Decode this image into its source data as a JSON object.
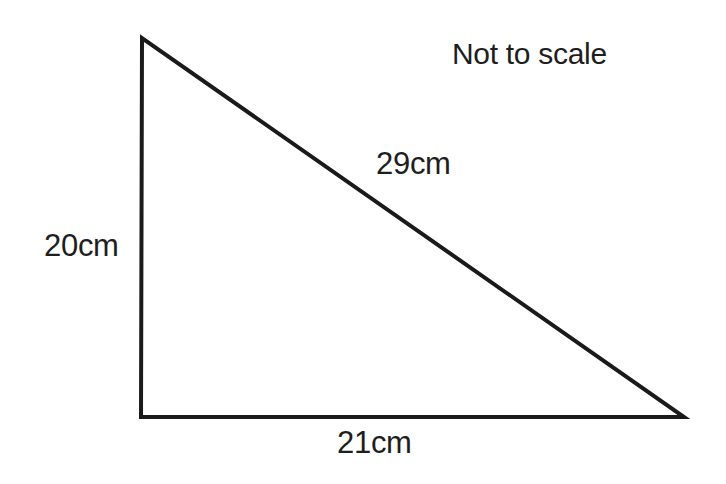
{
  "diagram": {
    "type": "right-triangle",
    "note": "Not to scale",
    "stroke_color": "#1a1a1a",
    "background_color": "#ffffff",
    "vertices": {
      "top": [
        142,
        38
      ],
      "bottom_left": [
        141,
        417
      ],
      "bottom_right": [
        684,
        417
      ]
    },
    "right_angle_at": "bottom_left",
    "sides": {
      "vertical": {
        "label": "20cm"
      },
      "horizontal": {
        "label": "21cm"
      },
      "hypotenuse": {
        "label": "29cm"
      }
    }
  }
}
